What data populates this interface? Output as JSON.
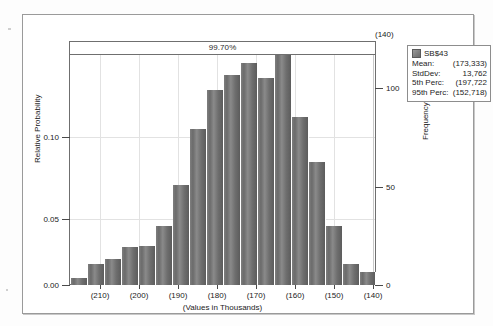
{
  "window": {
    "title": "Forecast Histogram"
  },
  "certainty": {
    "label": "99.70%"
  },
  "top_bin_label": "(140)",
  "axes": {
    "left_title": "Relative Probability",
    "right_title": "Frequency",
    "bottom_title": "(Values in Thousands)",
    "left_ticks": [
      "0.00",
      "0.05",
      "0.10"
    ],
    "right_ticks": [
      "0",
      "50",
      "100"
    ],
    "x_ticks": [
      "(210)",
      "(200)",
      "(190)",
      "(180)",
      "(170)",
      "(160)",
      "(150)",
      "(140)"
    ]
  },
  "legend": {
    "series_name": "SB$43",
    "rows": [
      {
        "key": "Mean:",
        "value": "(173,333)"
      },
      {
        "key": "StdDev:",
        "value": "13,762"
      },
      {
        "key": "5th Perc:",
        "value": "(197,722"
      },
      {
        "key": "95th Perc:",
        "value": "(152,718)"
      }
    ],
    "swatch_color": "#7a7a7a"
  },
  "chart_data": {
    "type": "bar",
    "title": "",
    "xlabel": "(Values in Thousands)",
    "ylabel": "Relative Probability",
    "y2label": "Frequency",
    "ylim": [
      0.0,
      0.14
    ],
    "y2lim": [
      0,
      117
    ],
    "grid": true,
    "legend_position": "top-right",
    "categories": [
      "(215)",
      "(212)",
      "(209)",
      "(206)",
      "(203)",
      "(200)",
      "(197)",
      "(194)",
      "(191)",
      "(188)",
      "(185)",
      "(182)",
      "(179)",
      "(176)",
      "(173)",
      "(170)",
      "(167)",
      "(164)"
    ],
    "x_tick_labels": [
      "(210)",
      "(200)",
      "(190)",
      "(180)",
      "(170)",
      "(160)",
      "(150)",
      "(140)"
    ],
    "series": [
      {
        "name": "SB$43",
        "values": [
          0.004,
          0.013,
          0.016,
          0.023,
          0.024,
          0.036,
          0.061,
          0.095,
          0.119,
          0.128,
          0.135,
          0.126,
          0.14,
          0.102,
          0.075,
          0.036,
          0.013,
          0.008
        ],
        "frequencies": [
          3,
          11,
          13,
          19,
          20,
          30,
          51,
          79,
          99,
          107,
          113,
          105,
          117,
          85,
          63,
          30,
          11,
          7
        ]
      }
    ],
    "annotations": [
      {
        "text": "99.70%",
        "type": "certainty-band",
        "position": "top"
      },
      {
        "text": "(140)",
        "type": "bin-label",
        "position": "top-right"
      }
    ]
  }
}
